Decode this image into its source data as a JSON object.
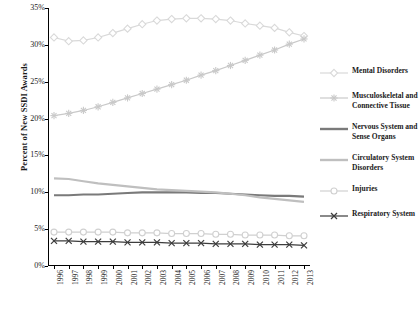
{
  "chart_data": {
    "type": "line",
    "title": "",
    "xlabel": "",
    "ylabel": "Percent of New SSDI Awards",
    "ylim": [
      0,
      35
    ],
    "ytick_labels": [
      "0%",
      "5%",
      "10%",
      "15%",
      "20%",
      "25%",
      "30%",
      "35%"
    ],
    "ytick_values": [
      0,
      5,
      10,
      15,
      20,
      25,
      30,
      35
    ],
    "grid": false,
    "legend_position": "right",
    "categories": [
      "1996",
      "1997",
      "1998",
      "1999",
      "2000",
      "2001",
      "2002",
      "2003",
      "2004",
      "2005",
      "2006",
      "2007",
      "2008",
      "2009",
      "2010",
      "2011",
      "2012",
      "2013"
    ],
    "series": [
      {
        "name": "Mental Disorders",
        "color": "#d9d9d9",
        "marker": "diamond",
        "values": [
          31.0,
          30.5,
          30.6,
          31.0,
          31.6,
          32.2,
          32.8,
          33.3,
          33.5,
          33.6,
          33.6,
          33.5,
          33.3,
          32.9,
          32.6,
          32.3,
          31.7,
          31.2
        ]
      },
      {
        "name": "Musculoskeletal and Connective Tissue",
        "color": "#c9c9c9",
        "marker": "asterisk",
        "values": [
          20.4,
          20.7,
          21.1,
          21.6,
          22.2,
          22.8,
          23.4,
          24.0,
          24.6,
          25.2,
          25.9,
          26.5,
          27.2,
          27.9,
          28.6,
          29.3,
          30.1,
          30.8
        ]
      },
      {
        "name": "Nervous System and Sense Organs",
        "color": "#7a7a7a",
        "marker": "none",
        "values": [
          9.6,
          9.6,
          9.7,
          9.7,
          9.8,
          9.9,
          10.0,
          10.0,
          10.0,
          10.0,
          9.9,
          9.9,
          9.8,
          9.7,
          9.6,
          9.5,
          9.5,
          9.4
        ]
      },
      {
        "name": "Circulatory System Disorders",
        "color": "#bfbfbf",
        "marker": "none",
        "values": [
          11.9,
          11.8,
          11.5,
          11.2,
          11.0,
          10.8,
          10.6,
          10.4,
          10.3,
          10.2,
          10.1,
          10.0,
          9.8,
          9.6,
          9.3,
          9.1,
          8.9,
          8.7
        ]
      },
      {
        "name": "Injuries",
        "color": "#d0d0d0",
        "marker": "circle",
        "values": [
          4.6,
          4.6,
          4.6,
          4.6,
          4.6,
          4.5,
          4.5,
          4.5,
          4.4,
          4.4,
          4.4,
          4.3,
          4.3,
          4.2,
          4.2,
          4.2,
          4.1,
          4.1
        ]
      },
      {
        "name": "Respiratory System",
        "color": "#3d3d3d",
        "marker": "x",
        "values": [
          3.4,
          3.4,
          3.3,
          3.3,
          3.3,
          3.2,
          3.2,
          3.2,
          3.1,
          3.1,
          3.1,
          3.0,
          3.0,
          3.0,
          2.9,
          2.9,
          2.9,
          2.8
        ]
      }
    ]
  }
}
